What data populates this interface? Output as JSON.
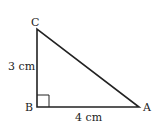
{
  "diagram": {
    "type": "right-triangle",
    "vertices": [
      {
        "name": "A",
        "label": "A"
      },
      {
        "name": "B",
        "label": "B"
      },
      {
        "name": "C",
        "label": "C"
      }
    ],
    "sides": {
      "BC": {
        "label": "3 cm"
      },
      "AB": {
        "label": "4 cm"
      }
    },
    "right_angle_at": "B",
    "line_color": "#222222"
  }
}
